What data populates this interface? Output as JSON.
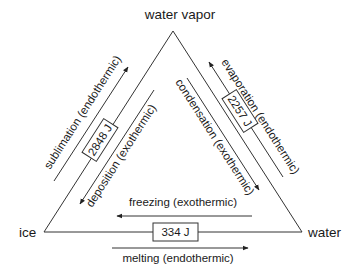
{
  "diagram": {
    "nodes": {
      "top": "water vapor",
      "left": "ice",
      "right": "water"
    },
    "edges": {
      "left": {
        "energy": "2848 J",
        "outer_process": "sublimation (endothermic)",
        "inner_process": "deposition (exothermic)"
      },
      "right": {
        "energy": "2257 J",
        "outer_process": "evaporation (endothermic)",
        "inner_process": "condensation (exothermic)"
      },
      "bottom": {
        "energy": "334 J",
        "upper_process": "freezing (exothermic)",
        "lower_process": "melting (endothermic)"
      }
    },
    "colors": {
      "line": "#333333",
      "text": "#1a1a1a",
      "background": "#ffffff"
    }
  }
}
